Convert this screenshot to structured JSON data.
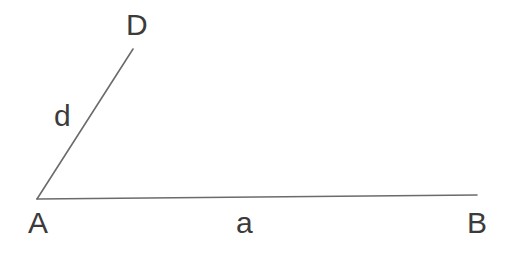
{
  "figure": {
    "type": "geometry-diagram",
    "background_color": "#ffffff",
    "width": 512,
    "height": 255
  },
  "style": {
    "stroke_color": "#6b6b6b",
    "stroke_width": 1.6,
    "label_color": "#3b3b3b",
    "label_font_size": 30
  },
  "points": {
    "A": {
      "label": "A",
      "x": 37,
      "y": 199
    },
    "B": {
      "label": "B",
      "x": 477,
      "y": 195
    },
    "D": {
      "label": "D",
      "x": 133,
      "y": 49
    }
  },
  "segments": [
    {
      "name": "segment-AB",
      "from": "A",
      "to": "B",
      "x1": 37,
      "y1": 199,
      "x2": 477,
      "y2": 195,
      "side_label": "a"
    },
    {
      "name": "segment-AD",
      "from": "A",
      "to": "D",
      "x1": 37,
      "y1": 199,
      "x2": 133,
      "y2": 49,
      "side_label": "d"
    }
  ],
  "labels": {
    "vertex_D": "D",
    "vertex_A": "A",
    "vertex_B": "B",
    "side_d": "d",
    "side_a": "a"
  }
}
